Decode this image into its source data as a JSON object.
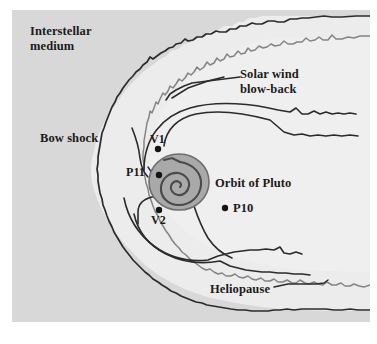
{
  "figure": {
    "kind": "heliosphere-schematic",
    "frame": {
      "background_color": "#ececec",
      "border_color": "#dcdcdc"
    }
  },
  "labels": {
    "interstellar_medium": "Interstellar\nmedium",
    "solar_wind_blowback": "Solar wind\nblow-back",
    "bow_shock": "Bow shock",
    "orbit_of_pluto": "Orbit of Pluto",
    "heliopause": "Heliopause"
  },
  "probes": [
    {
      "id": "v1",
      "label": "V1",
      "x": 146,
      "y": 139
    },
    {
      "id": "p11",
      "label": "P11",
      "x": 147,
      "y": 165
    },
    {
      "id": "v2",
      "label": "V2",
      "x": 147,
      "y": 200
    },
    {
      "id": "p10",
      "label": "P10",
      "x": 213,
      "y": 198
    }
  ],
  "colors": {
    "page_background": "#ffffff",
    "frame_fill": "#ececec",
    "interstellar_fill": "#d8d8d8",
    "heliosheath_fill": "#e9e9e9",
    "inner_fill": "#efefef",
    "bow_shock_line": "#2b2b2b",
    "heliopause_line": "#7a7a7a",
    "solar_wind_line": "#2b2b2b",
    "sun_disc_fill": "#a9a9a9",
    "sun_disc_edge": "#6e6e6e",
    "spiral_line": "#4a4a4a",
    "dot_color": "#141414",
    "text_color": "#1b1b1b"
  },
  "contours": {
    "bow_shock_name": "bow-shock-contour",
    "heliopause_name": "heliopause-contour",
    "termination_shock_name": "termination-shock-contour",
    "blowback_name": "solar-wind-blowback-contour"
  }
}
